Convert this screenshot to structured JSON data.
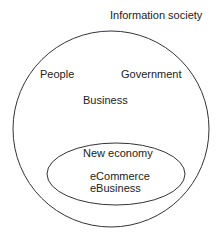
{
  "diagram": {
    "outer_label": "Information society",
    "inner_labels": {
      "people": "People",
      "government": "Government",
      "business": "Business"
    },
    "ellipse": {
      "title": "New economy",
      "line1": "eCommerce",
      "line2": "eBusiness"
    }
  }
}
